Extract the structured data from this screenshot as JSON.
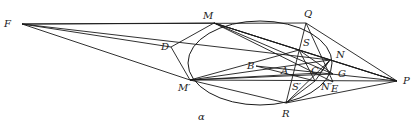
{
  "figure": {
    "type": "projective-geometry-construction",
    "conic_label": "α",
    "points": [
      {
        "id": "F",
        "label": "F"
      },
      {
        "id": "M",
        "label": "M"
      },
      {
        "id": "Q",
        "label": "Q"
      },
      {
        "id": "D",
        "label": "D"
      },
      {
        "id": "S",
        "label": "S"
      },
      {
        "id": "N",
        "label": "N"
      },
      {
        "id": "B",
        "label": "B"
      },
      {
        "id": "A",
        "label": "A"
      },
      {
        "id": "C",
        "label": "C"
      },
      {
        "id": "G",
        "label": "G"
      },
      {
        "id": "Mp",
        "label": "M′"
      },
      {
        "id": "Sp",
        "label": "S′"
      },
      {
        "id": "Np",
        "label": "N′"
      },
      {
        "id": "E",
        "label": "E"
      },
      {
        "id": "P",
        "label": "P"
      },
      {
        "id": "R",
        "label": "R"
      }
    ],
    "segments": [
      [
        "F",
        "M"
      ],
      [
        "F",
        "Q"
      ],
      [
        "F",
        "D"
      ],
      [
        "F",
        "Mp"
      ],
      [
        "F",
        "N"
      ],
      [
        "M",
        "D"
      ],
      [
        "D",
        "Mp"
      ],
      [
        "M",
        "S"
      ],
      [
        "M",
        "N"
      ],
      [
        "M",
        "G"
      ],
      [
        "M",
        "P"
      ],
      [
        "M",
        "E"
      ],
      [
        "Q",
        "P"
      ],
      [
        "Q",
        "R"
      ],
      [
        "Q",
        "E"
      ],
      [
        "Mp",
        "S"
      ],
      [
        "Mp",
        "N"
      ],
      [
        "Mp",
        "P"
      ],
      [
        "Mp",
        "R"
      ],
      [
        "Mp",
        "C"
      ],
      [
        "Mp",
        "G"
      ],
      [
        "S",
        "Np"
      ],
      [
        "S",
        "P"
      ],
      [
        "S",
        "G"
      ],
      [
        "N",
        "Np"
      ],
      [
        "N",
        "P"
      ],
      [
        "N",
        "C"
      ],
      [
        "B",
        "P"
      ],
      [
        "B",
        "Np"
      ],
      [
        "R",
        "P"
      ],
      [
        "R",
        "N"
      ],
      [
        "R",
        "Np"
      ]
    ]
  }
}
